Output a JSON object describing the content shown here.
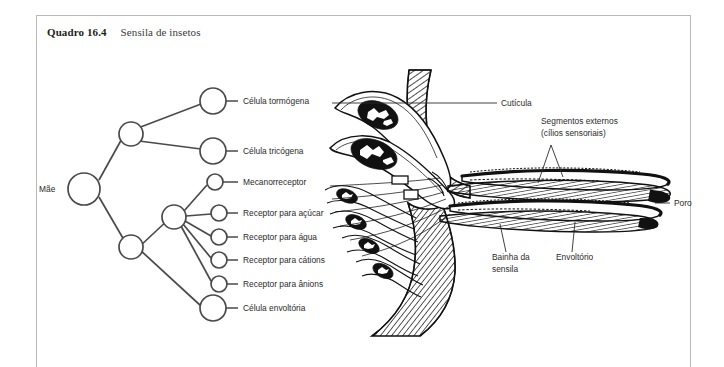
{
  "figure": {
    "caption_number": "Quadro 16.4",
    "caption_text": "Sensila de insetos"
  },
  "lineage_tree": {
    "root_label": "Mãe",
    "leaf_labels": [
      "Célula tormógena",
      "Célula tricógena",
      "Mecanorreceptor",
      "Receptor para açúcar",
      "Receptor para água",
      "Receptor para cátions",
      "Receptor para ânions",
      "Célula envoltória"
    ]
  },
  "anatomy_labels": {
    "cuticle": "Cutícula",
    "outer_segments_line1": "Segmentos externos",
    "outer_segments_line2": "(cílios sensoriais)",
    "pore": "Poro",
    "sheath_line1": "Bainha da",
    "sheath_line2": "sensila",
    "envelope": "Envoltório"
  },
  "colors": {
    "ink": "#111111",
    "line": "#4a4a4a",
    "text": "#2b2b2b",
    "frame": "#b9b9b9",
    "background": "#ffffff"
  }
}
